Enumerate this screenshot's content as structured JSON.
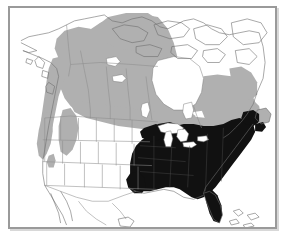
{
  "figure": {
    "kind": "range-distribution-map",
    "region": "North America",
    "title": "",
    "caption": "",
    "frame": {
      "visible": true,
      "border_color": "#9a9a9a"
    },
    "background_color": "#ffffff"
  },
  "legend": {
    "visible": false,
    "classes": [
      {
        "key": "breeding-range",
        "label": "",
        "color": "#111111",
        "region": "Eastern United States"
      },
      {
        "key": "secondary-range",
        "label": "",
        "color": "#b0b0b0",
        "region": "Boreal Canada, Pacific Northwest, Rocky Mountains"
      },
      {
        "key": "absent",
        "label": "",
        "color": "#ffffff",
        "region": "Arctic Canada, Mexico, Great Basin"
      }
    ]
  },
  "map": {
    "outline_color": "#6e6e6e",
    "boundary_color": "#8c8c8c",
    "land_fill": "#ffffff",
    "water_fill": "#ffffff",
    "shaded_dark_color": "#111111",
    "shaded_light_color": "#b0b0b0",
    "features": [
      {
        "name": "alaska",
        "label": "Alaska",
        "shading": "partial-light"
      },
      {
        "name": "yukon",
        "label": "Yukon",
        "shading": "light"
      },
      {
        "name": "british-columbia",
        "label": "British Columbia",
        "shading": "light"
      },
      {
        "name": "northwest-territories",
        "label": "Northwest Territories",
        "shading": "light"
      },
      {
        "name": "arctic-archipelago",
        "label": "Arctic Archipelago",
        "shading": "none"
      },
      {
        "name": "hudson-bay",
        "label": "Hudson Bay",
        "shading": "none"
      },
      {
        "name": "quebec-labrador",
        "label": "Quebec and Labrador",
        "shading": "light"
      },
      {
        "name": "newfoundland",
        "label": "Newfoundland",
        "shading": "light"
      },
      {
        "name": "maritimes",
        "label": "Maritime Provinces",
        "shading": "dark"
      },
      {
        "name": "great-lakes",
        "label": "Great Lakes",
        "shading": "none"
      },
      {
        "name": "eastern-united-states",
        "label": "Eastern United States",
        "shading": "dark"
      },
      {
        "name": "florida",
        "label": "Florida",
        "shading": "dark"
      },
      {
        "name": "pacific-northwest",
        "label": "Pacific Northwest",
        "shading": "light"
      },
      {
        "name": "rocky-mountains",
        "label": "Rocky Mountains",
        "shading": "light"
      },
      {
        "name": "great-basin",
        "label": "Great Basin",
        "shading": "none"
      },
      {
        "name": "mexico",
        "label": "Mexico",
        "shading": "none"
      }
    ]
  }
}
